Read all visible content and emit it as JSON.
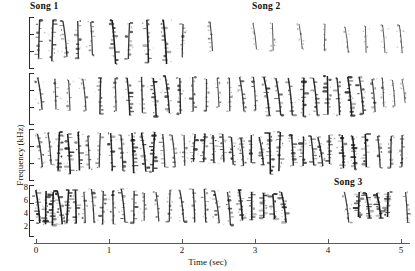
{
  "figure": {
    "type": "spectrogram",
    "width": 415,
    "height": 271
  },
  "annotations": [
    {
      "text": "Song 1",
      "x": 30,
      "y": 2
    },
    {
      "text": "Song 2",
      "x": 252,
      "y": 2
    },
    {
      "text": "Song 3",
      "x": 334,
      "y": 177
    }
  ],
  "axes": {
    "y": {
      "label": "Frequency (kHz)",
      "ticks": [
        8,
        6,
        4,
        2
      ],
      "unit": "kHz",
      "min": 2,
      "max": 8
    },
    "x": {
      "label": "Time (sec)",
      "ticks": [
        0,
        1,
        2,
        3,
        4,
        5
      ],
      "min": 0,
      "max": 5.25,
      "unit": "sec"
    }
  },
  "chart_data": {
    "type": "line",
    "title": "",
    "xlabel": "Time (sec)",
    "ylabel": "Frequency (kHz)",
    "xlim": [
      0,
      5.25
    ],
    "ylim": [
      2,
      8
    ],
    "grid": false,
    "legend": "none",
    "rows": [
      {
        "row": 1,
        "label": "Song 1",
        "syllable_times": [
          0.04,
          0.23,
          0.4,
          0.57,
          0.76,
          1.07,
          1.27,
          1.53,
          1.77,
          2.01,
          2.4,
          3.0,
          3.24,
          3.62,
          3.96,
          4.26,
          4.52,
          4.77,
          4.99
        ],
        "syllable_heights": [
          3.0,
          3.2,
          2.8,
          2.9,
          2.6,
          3.4,
          2.8,
          3.3,
          3.4,
          2.6,
          2.3,
          2.1,
          2.2,
          2.0,
          2.1,
          2.0,
          2.1,
          2.2,
          2.2
        ],
        "syllable_density": [
          0.75,
          0.85,
          0.7,
          0.72,
          0.6,
          0.95,
          0.7,
          0.9,
          0.98,
          0.62,
          0.5,
          0.35,
          0.36,
          0.32,
          0.34,
          0.33,
          0.35,
          0.36,
          0.36
        ]
      },
      {
        "row": 2,
        "label": "",
        "syllable_times": [
          0.05,
          0.26,
          0.45,
          0.66,
          0.88,
          1.09,
          1.26,
          1.45,
          1.62,
          1.8,
          1.98,
          2.15,
          2.33,
          2.5,
          2.65,
          2.82,
          2.99,
          3.16,
          3.32,
          3.49,
          3.66,
          3.83,
          3.99,
          4.14,
          4.3,
          4.46,
          4.62,
          4.76,
          4.9,
          5.04
        ],
        "syllable_heights": [
          2.5,
          2.4,
          2.4,
          2.5,
          2.8,
          2.6,
          2.9,
          2.8,
          3.0,
          2.9,
          2.8,
          2.7,
          2.5,
          2.3,
          2.6,
          2.7,
          2.6,
          3.0,
          2.9,
          2.9,
          3.0,
          2.9,
          3.0,
          2.9,
          3.0,
          2.9,
          2.6,
          2.3,
          2.1,
          1.9
        ],
        "syllable_density": [
          0.7,
          0.55,
          0.5,
          0.55,
          0.8,
          0.6,
          0.85,
          0.7,
          0.92,
          0.8,
          0.75,
          0.7,
          0.55,
          0.45,
          0.6,
          0.65,
          0.6,
          0.9,
          0.8,
          0.8,
          0.9,
          0.82,
          0.9,
          0.8,
          0.92,
          0.8,
          0.6,
          0.45,
          0.35,
          0.3
        ]
      },
      {
        "row": 3,
        "label": "",
        "syllable_times": [
          0.05,
          0.18,
          0.31,
          0.45,
          0.58,
          0.72,
          0.88,
          1.03,
          1.18,
          1.33,
          1.47,
          1.61,
          1.75,
          1.89,
          2.03,
          2.17,
          2.3,
          2.43,
          2.56,
          2.69,
          2.82,
          2.95,
          3.08,
          3.21,
          3.34,
          3.52,
          3.66,
          3.78,
          3.9,
          4.02,
          4.2,
          4.36,
          4.52,
          4.7,
          4.86,
          5.02
        ],
        "syllable_heights": [
          2.6,
          2.5,
          3.0,
          3.1,
          3.0,
          2.6,
          2.7,
          2.9,
          2.8,
          3.1,
          3.0,
          3.1,
          2.6,
          2.5,
          2.4,
          2.2,
          2.2,
          2.2,
          2.2,
          2.2,
          2.2,
          2.2,
          2.2,
          3.2,
          3.0,
          2.4,
          2.3,
          2.3,
          2.3,
          2.3,
          2.6,
          2.6,
          2.6,
          2.5,
          2.5,
          2.5
        ],
        "syllable_density": [
          0.7,
          0.6,
          0.95,
          0.98,
          0.95,
          0.6,
          0.65,
          0.85,
          0.7,
          0.95,
          0.9,
          0.95,
          0.65,
          0.6,
          0.55,
          0.8,
          0.82,
          0.85,
          0.8,
          0.8,
          0.78,
          0.8,
          0.8,
          0.99,
          0.9,
          0.85,
          0.82,
          0.82,
          0.8,
          0.8,
          0.95,
          0.95,
          0.95,
          0.7,
          0.7,
          0.72
        ]
      },
      {
        "row": 4,
        "label": "Song 3",
        "syllable_times": [
          0.03,
          0.13,
          0.23,
          0.33,
          0.43,
          0.54,
          0.66,
          0.78,
          0.92,
          1.06,
          1.2,
          1.34,
          1.48,
          1.66,
          1.83,
          2.0,
          2.16,
          2.32,
          2.48,
          2.64,
          2.8,
          2.96,
          3.12,
          3.26,
          3.4,
          4.26,
          4.42,
          4.54,
          4.7,
          4.82,
          5.08
        ],
        "syllable_heights": [
          2.6,
          2.6,
          2.6,
          2.6,
          2.6,
          2.6,
          2.4,
          2.6,
          2.6,
          2.6,
          2.6,
          2.5,
          2.2,
          2.3,
          2.5,
          2.5,
          2.6,
          2.6,
          2.5,
          2.6,
          2.4,
          2.2,
          2.0,
          2.0,
          2.4,
          2.4,
          2.0,
          2.0,
          2.0,
          2.0,
          2.4
        ],
        "syllable_density": [
          0.95,
          0.95,
          0.95,
          0.95,
          0.95,
          0.95,
          0.6,
          0.65,
          0.7,
          0.72,
          0.75,
          0.7,
          0.5,
          0.55,
          0.62,
          0.65,
          0.7,
          0.72,
          0.68,
          0.7,
          0.95,
          0.92,
          0.9,
          0.9,
          0.92,
          0.6,
          0.95,
          0.95,
          0.95,
          0.95,
          0.6
        ]
      }
    ]
  },
  "colors": {
    "background": "#ffffff",
    "ink": "#1a1a1a",
    "axis": "#4a4a4a"
  }
}
